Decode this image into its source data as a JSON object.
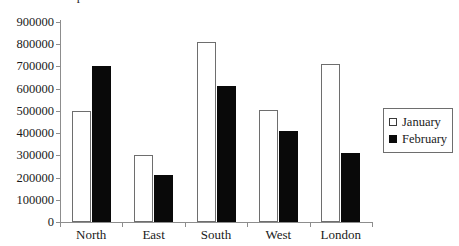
{
  "title_fragment": "p",
  "legend": {
    "position": "right",
    "entries": [
      {
        "label": "January",
        "marker": "hollow-square",
        "color": "#ffffff"
      },
      {
        "label": "February",
        "marker": "filled-square",
        "color": "#090909"
      }
    ]
  },
  "axis": {
    "y_ticks": [
      "900000",
      "800000",
      "700000",
      "600000",
      "500000",
      "400000",
      "300000",
      "200000",
      "100000",
      "0"
    ],
    "x_ticks": [
      "North",
      "East",
      "South",
      "West",
      "London"
    ]
  },
  "chart_data": {
    "type": "bar",
    "title": "",
    "xlabel": "",
    "ylabel": "",
    "ylim": [
      0,
      900000
    ],
    "ytick_step": 100000,
    "grid": false,
    "legend_position": "right",
    "categories": [
      "North",
      "East",
      "South",
      "West",
      "London"
    ],
    "series": [
      {
        "name": "January",
        "color": "#ffffff",
        "values": [
          500000,
          300000,
          810000,
          505000,
          710000
        ]
      },
      {
        "name": "February",
        "color": "#090909",
        "values": [
          700000,
          210000,
          610000,
          410000,
          310000
        ]
      }
    ]
  }
}
